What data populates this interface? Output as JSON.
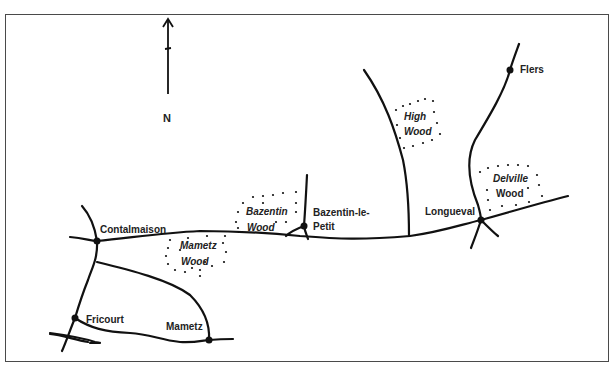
{
  "map": {
    "compass": {
      "label": "N"
    },
    "towns": [
      {
        "name": "Contalmaison",
        "x": 97,
        "y": 241
      },
      {
        "name": "Bazentin-le-",
        "line2": "Petit",
        "x": 304,
        "y": 226
      },
      {
        "name": "Longueval",
        "x": 481,
        "y": 220
      },
      {
        "name": "Flers",
        "x": 510,
        "y": 70
      },
      {
        "name": "Fricourt",
        "x": 75,
        "y": 318
      },
      {
        "name": "Mametz",
        "x": 209,
        "y": 340
      }
    ],
    "woods": [
      {
        "line1": "Bazentin",
        "line2": "Wood"
      },
      {
        "line1": "Mametz",
        "line2": "Wood"
      },
      {
        "line1": "High",
        "line2": "Wood"
      },
      {
        "line1": "Delville",
        "line2": "Wood"
      }
    ],
    "colors": {
      "ink": "#111111",
      "border": "#4a4a4a",
      "background": "#ffffff"
    }
  }
}
